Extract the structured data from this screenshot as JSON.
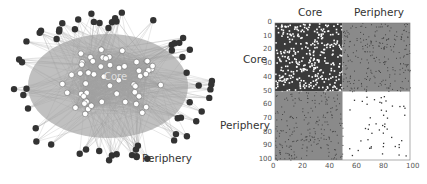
{
  "network": {
    "core_label": "Core",
    "periphery_label": "Periphery",
    "core_node_color": "#ffffff",
    "periphery_node_color": "#333333",
    "edge_color": "#a0a0a0",
    "background_blob_color": "#8c8c8c"
  },
  "matrix": {
    "col_labels": [
      "Core",
      "Periphery"
    ],
    "row_labels": [
      "Core",
      "Periphery"
    ],
    "y_ticks": [
      "0",
      "10",
      "20",
      "30",
      "40",
      "50",
      "60",
      "70",
      "80",
      "90",
      "100"
    ],
    "x_ticks": [
      "0",
      "20",
      "40",
      "60",
      "80",
      "100"
    ],
    "block_split": 50,
    "colors": {
      "core_core": "#ffffff",
      "core_dense": "#3a3a3a",
      "off_diag": "#8a8a8a",
      "periph_periph": "#ffffff",
      "dot": "#333333"
    }
  }
}
